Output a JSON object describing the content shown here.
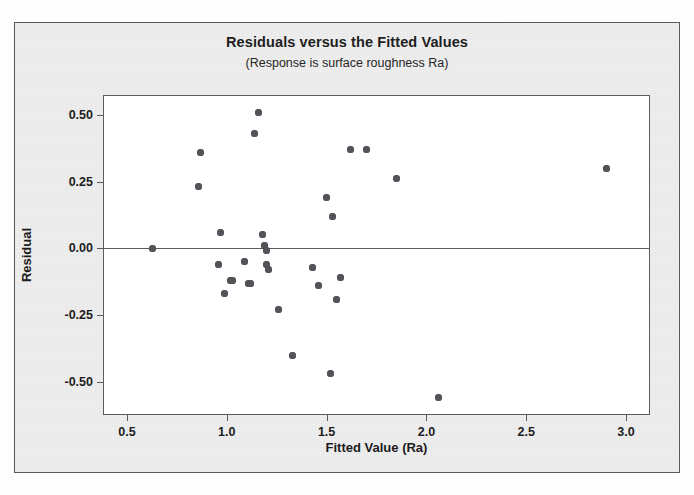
{
  "figure": {
    "title": "Residuals versus the Fitted Values",
    "subtitle": "(Response is surface roughness Ra)",
    "background_color": "#ededed",
    "plot_background_color": "#ffffff",
    "border_color": "#59595c",
    "marker_color": "#53535a"
  },
  "chart_data": {
    "type": "scatter",
    "title": "Residuals versus the Fitted Values",
    "subtitle": "(Response is surface roughness Ra)",
    "xlabel": "Fitted Value (Ra)",
    "ylabel": "Residual",
    "xlim": [
      0.385,
      3.115
    ],
    "ylim": [
      -0.62,
      0.57
    ],
    "xticks": [
      0.5,
      1.0,
      1.5,
      2.0,
      2.5,
      3.0
    ],
    "xtick_labels": [
      "0.5",
      "1.0",
      "1.5",
      "2.0",
      "2.5",
      "3.0"
    ],
    "yticks": [
      0.5,
      0.25,
      0.0,
      -0.25,
      -0.5
    ],
    "ytick_labels": [
      "0.50",
      "0.25",
      "0.00",
      "-0.25",
      "-0.50"
    ],
    "grid": false,
    "legend": false,
    "reference_line": {
      "axis": "y",
      "value": 0.0,
      "color": "#5d5d60"
    },
    "series": [
      {
        "name": "Residuals",
        "marker": "circle",
        "color": "#53535a",
        "x": [
          0.63,
          0.86,
          0.87,
          0.96,
          0.97,
          0.99,
          1.02,
          1.03,
          1.09,
          1.11,
          1.12,
          1.14,
          1.16,
          1.18,
          1.19,
          1.2,
          1.2,
          1.21,
          1.26,
          1.33,
          1.43,
          1.46,
          1.5,
          1.52,
          1.53,
          1.55,
          1.57,
          1.62,
          1.7,
          1.85,
          2.06,
          2.9
        ],
        "y": [
          0.0,
          0.23,
          0.36,
          -0.06,
          0.06,
          -0.17,
          -0.12,
          -0.12,
          -0.05,
          -0.13,
          -0.13,
          0.43,
          0.51,
          0.05,
          0.01,
          -0.01,
          -0.06,
          -0.08,
          -0.23,
          -0.4,
          -0.07,
          -0.14,
          0.19,
          -0.47,
          0.12,
          -0.19,
          -0.11,
          0.37,
          0.37,
          0.26,
          -0.56,
          0.3
        ]
      }
    ]
  }
}
